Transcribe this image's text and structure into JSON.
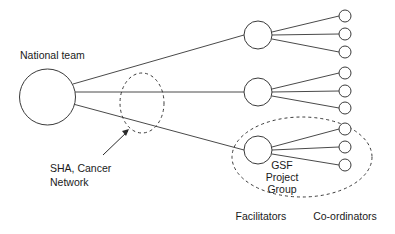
{
  "diagram": {
    "background_color": "#ffffff",
    "stroke_color": "#3a3a3a",
    "text_color": "#1a1a1a",
    "labels": {
      "national_team": "National team",
      "sha_cancer_network_line1": "SHA, Cancer",
      "sha_cancer_network_line2": "Network",
      "gsf_line1": "GSF",
      "gsf_line2": "Project",
      "gsf_line3": "Group",
      "column_facilitators": "Facilitators",
      "column_coordinators": "Co-ordinators"
    },
    "nodes": {
      "root": {
        "name": "National team",
        "cx": 47.5,
        "cy": 97,
        "r": 28
      },
      "facilitators": [
        {
          "name": "facilitator-1",
          "cx": 258,
          "cy": 35,
          "r": 14
        },
        {
          "name": "facilitator-2",
          "cx": 258,
          "cy": 92,
          "r": 14
        },
        {
          "name": "facilitator-3",
          "cx": 258,
          "cy": 150,
          "r": 14
        }
      ],
      "coordinators": [
        {
          "name": "coordinator-1",
          "cx": 345,
          "cy": 16,
          "r": 6
        },
        {
          "name": "coordinator-2",
          "cx": 345,
          "cy": 34,
          "r": 6
        },
        {
          "name": "coordinator-3",
          "cx": 345,
          "cy": 52,
          "r": 6
        },
        {
          "name": "coordinator-4",
          "cx": 345,
          "cy": 73,
          "r": 6
        },
        {
          "name": "coordinator-5",
          "cx": 345,
          "cy": 91,
          "r": 6
        },
        {
          "name": "coordinator-6",
          "cx": 345,
          "cy": 108,
          "r": 6
        },
        {
          "name": "coordinator-7",
          "cx": 345,
          "cy": 129,
          "r": 6
        },
        {
          "name": "coordinator-8",
          "cx": 345,
          "cy": 147,
          "r": 6
        },
        {
          "name": "coordinator-9",
          "cx": 345,
          "cy": 165,
          "r": 6
        }
      ]
    },
    "groups": [
      {
        "name": "sha-cancer-network-ellipse",
        "cx": 142,
        "cy": 103,
        "rx": 22,
        "ry": 30,
        "dashed": true
      },
      {
        "name": "gsf-project-group-ellipse",
        "cx": 302,
        "cy": 157,
        "rx": 70,
        "ry": 40,
        "dashed": true
      }
    ],
    "counts": {
      "facilitators": 3,
      "coordinators": 9,
      "coordinators_per_facilitator": 3
    }
  }
}
